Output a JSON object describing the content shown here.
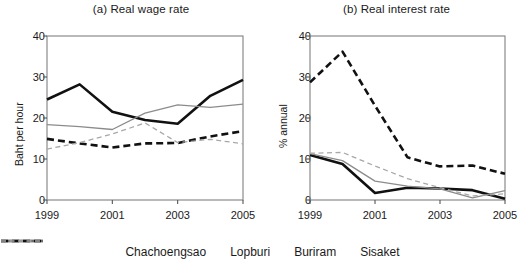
{
  "figure": {
    "width": 525,
    "height": 268,
    "background": "#ffffff"
  },
  "legend": {
    "position": "bottom-center",
    "items": [
      {
        "label": "Chachoengsao",
        "color": "#111111",
        "style": "solid",
        "width": 2.6,
        "swatch": "thick-black-solid-line"
      },
      {
        "label": "Lopburi",
        "color": "#8c8c8c",
        "style": "solid",
        "width": 1.3,
        "swatch": "thin-gray-solid-line"
      },
      {
        "label": "Buriram",
        "color": "#111111",
        "style": "dashed",
        "width": 2.6,
        "swatch": "thick-black-dashed-line"
      },
      {
        "label": "Sisaket",
        "color": "#a8a8a8",
        "style": "dashed",
        "width": 1.3,
        "swatch": "thin-gray-dashed-line"
      }
    ]
  },
  "chart_data": [
    {
      "type": "line",
      "title": "(a) Real wage rate",
      "xlabel": "",
      "ylabel": "Baht per hour",
      "x": [
        1999,
        2000,
        2001,
        2002,
        2003,
        2004,
        2005
      ],
      "xticks": [
        "1999",
        "2001",
        "2003",
        "2005"
      ],
      "xtick_values": [
        1999,
        2001,
        2003,
        2005
      ],
      "xlim": [
        1999,
        2005
      ],
      "ylim": [
        0,
        40
      ],
      "yticks": [
        "0",
        "10",
        "20",
        "30",
        "40"
      ],
      "ytick_values": [
        0,
        10,
        20,
        30,
        40
      ],
      "grid": false,
      "series": [
        {
          "name": "Chachoengsao",
          "color": "#111111",
          "style": "solid",
          "width": 2.6,
          "values": [
            24.5,
            28.2,
            21.5,
            19.5,
            18.6,
            25.4,
            29.3
          ]
        },
        {
          "name": "Lopburi",
          "color": "#8c8c8c",
          "style": "solid",
          "width": 1.3,
          "values": [
            18.4,
            17.9,
            17.2,
            21.2,
            23.2,
            22.6,
            23.4
          ]
        },
        {
          "name": "Buriram",
          "color": "#111111",
          "style": "dashed",
          "width": 2.6,
          "values": [
            14.9,
            13.8,
            12.8,
            13.8,
            13.9,
            15.5,
            16.8
          ]
        },
        {
          "name": "Sisaket",
          "color": "#a8a8a8",
          "style": "dashed",
          "width": 1.3,
          "values": [
            12.4,
            14.0,
            16.1,
            18.8,
            14.0,
            14.8,
            13.7
          ]
        }
      ]
    },
    {
      "type": "line",
      "title": "(b) Real interest rate",
      "xlabel": "",
      "ylabel": "% annual",
      "x": [
        1999,
        2000,
        2001,
        2002,
        2003,
        2004,
        2005
      ],
      "xticks": [
        "1999",
        "2001",
        "2003",
        "2005"
      ],
      "xtick_values": [
        1999,
        2001,
        2003,
        2005
      ],
      "xlim": [
        1999,
        2005
      ],
      "ylim": [
        0,
        40
      ],
      "yticks": [
        "0",
        "10",
        "20",
        "30",
        "40"
      ],
      "ytick_values": [
        0,
        10,
        20,
        30,
        40
      ],
      "grid": false,
      "series": [
        {
          "name": "Chachoengsao",
          "color": "#111111",
          "style": "solid",
          "width": 2.6,
          "values": [
            11.0,
            8.8,
            1.7,
            3.0,
            2.8,
            2.4,
            0.3
          ]
        },
        {
          "name": "Lopburi",
          "color": "#8c8c8c",
          "style": "solid",
          "width": 1.3,
          "values": [
            11.3,
            9.6,
            4.6,
            3.4,
            2.7,
            0.5,
            2.3
          ]
        },
        {
          "name": "Buriram",
          "color": "#111111",
          "style": "dashed",
          "width": 2.6,
          "values": [
            28.7,
            36.2,
            23.0,
            10.4,
            8.2,
            8.4,
            6.4
          ]
        },
        {
          "name": "Sisaket",
          "color": "#a8a8a8",
          "style": "dashed",
          "width": 1.3,
          "values": [
            11.4,
            11.6,
            8.3,
            5.2,
            3.0,
            1.0,
            1.5
          ]
        }
      ]
    }
  ]
}
